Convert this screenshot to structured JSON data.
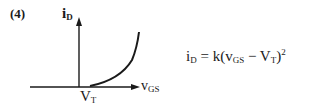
{
  "figure": {
    "number_label": "(4)",
    "y_axis": {
      "var": "i",
      "sub": "D"
    },
    "x_axis": {
      "var": "v",
      "sub": "GS"
    },
    "threshold_label": {
      "var": "V",
      "sub": "T"
    },
    "equation": {
      "lhs_var": "i",
      "lhs_sub": "D",
      "equals": " = k(",
      "term1_var": "v",
      "term1_sub": "GS",
      "minus": " − ",
      "term2_var": "V",
      "term2_sub": "T",
      "close": ")",
      "exponent": "2"
    },
    "colors": {
      "ink": "#1a1a1a",
      "background": "#ffffff"
    }
  }
}
